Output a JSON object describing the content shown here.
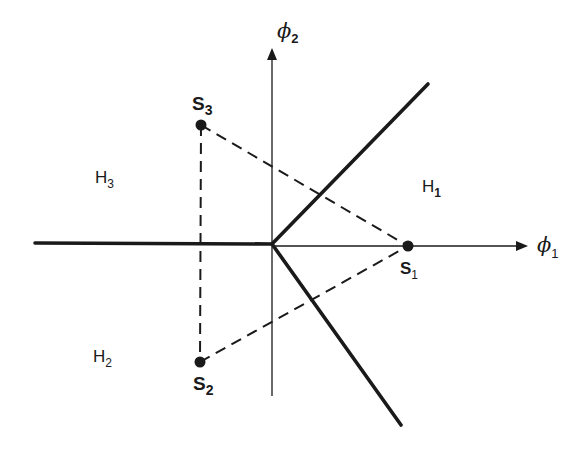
{
  "diagram": {
    "type": "decision-region-diagram",
    "axes": {
      "horizontal": {
        "label": "ϕ",
        "subscript": "1"
      },
      "vertical": {
        "label": "ϕ",
        "subscript": "2"
      }
    },
    "points": [
      {
        "name": "S",
        "subscript": "1",
        "x": 408,
        "y": 246
      },
      {
        "name": "S",
        "subscript": "2",
        "x": 200,
        "y": 362
      },
      {
        "name": "S",
        "subscript": "3",
        "x": 201,
        "y": 125
      }
    ],
    "regions": [
      {
        "name": "H",
        "subscript": "1"
      },
      {
        "name": "H",
        "subscript": "2"
      },
      {
        "name": "H",
        "subscript": "3"
      }
    ],
    "boundaries": {
      "junction": {
        "x": 272,
        "y": 244
      },
      "upper_right_end": {
        "x": 428,
        "y": 84
      },
      "lower_right_end": {
        "x": 401,
        "y": 425
      },
      "left_end": {
        "x": 35,
        "y": 243
      }
    },
    "colors": {
      "ink": "#1a1a1a",
      "background": "#ffffff"
    }
  }
}
